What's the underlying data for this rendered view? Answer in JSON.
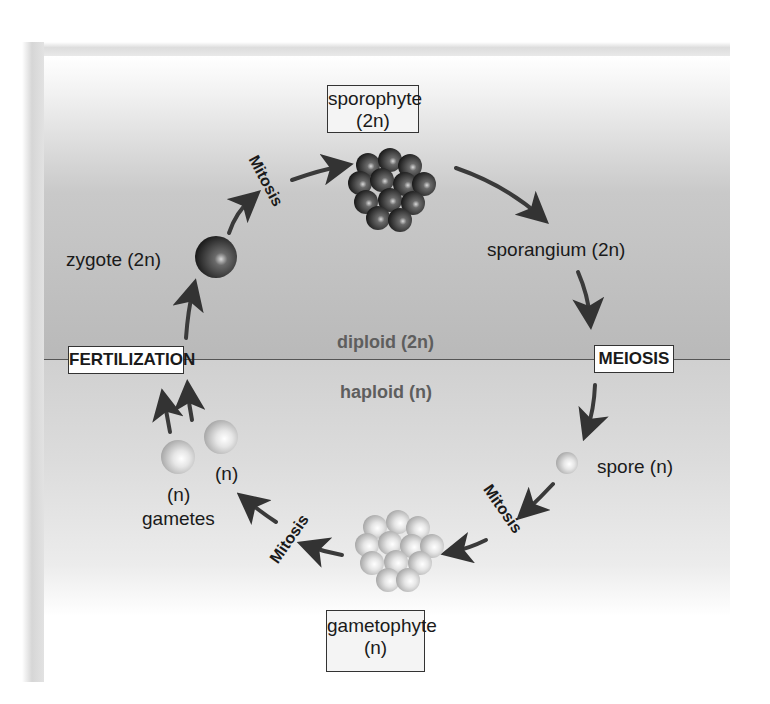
{
  "diagram": {
    "zones": {
      "upper": "diploid (2n)",
      "lower": "haploid (n)"
    },
    "boxes": {
      "sporophyte": {
        "line1": "sporophyte",
        "line2": "(2n)"
      },
      "gametophyte": {
        "line1": "gametophyte",
        "line2": "(n)"
      },
      "fertilization": "FERTILIZATION",
      "meiosis": "MEIOSIS"
    },
    "labels": {
      "sporangium": "sporangium (2n)",
      "spore": "spore (n)",
      "zygote": "zygote (2n)",
      "gamete1": "(n)",
      "gamete2": "(n)",
      "gametes": "gametes"
    },
    "processes": {
      "mitosis_top": "Mitosis",
      "mitosis_right": "Mitosis",
      "mitosis_left": "Mitosis"
    },
    "cycle_order": [
      "zygote (2n)",
      "Mitosis",
      "sporophyte (2n)",
      "sporangium (2n)",
      "MEIOSIS",
      "spore (n)",
      "Mitosis",
      "gametophyte (n)",
      "Mitosis",
      "gametes",
      "FERTILIZATION"
    ],
    "colors": {
      "diploid_bg": "#bdbdbd",
      "haploid_bg": "#dedede",
      "arrow": "#3a3a3a",
      "diploid_cell": "#3c3c3c",
      "haploid_cell": "#d6d6d6"
    }
  }
}
